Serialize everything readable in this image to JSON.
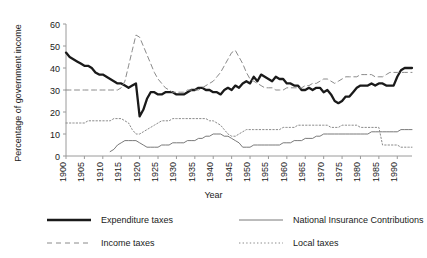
{
  "chart_data": {
    "type": "line",
    "title": "",
    "xlabel": "Year",
    "ylabel": "Percentage of government income",
    "xlim": [
      1900,
      1994
    ],
    "ylim": [
      0,
      60
    ],
    "yticks": [
      0,
      10,
      20,
      30,
      40,
      50,
      60
    ],
    "xticks": [
      1900,
      1905,
      1910,
      1915,
      1920,
      1925,
      1930,
      1935,
      1940,
      1945,
      1950,
      1955,
      1960,
      1965,
      1970,
      1975,
      1980,
      1985,
      1990
    ],
    "grid": false,
    "legend_position": "below",
    "x": [
      1900,
      1901,
      1902,
      1903,
      1904,
      1905,
      1906,
      1907,
      1908,
      1909,
      1910,
      1911,
      1912,
      1913,
      1914,
      1915,
      1916,
      1917,
      1918,
      1919,
      1920,
      1921,
      1922,
      1923,
      1924,
      1925,
      1926,
      1927,
      1928,
      1929,
      1930,
      1931,
      1932,
      1933,
      1934,
      1935,
      1936,
      1937,
      1938,
      1939,
      1940,
      1941,
      1942,
      1943,
      1944,
      1945,
      1946,
      1947,
      1948,
      1949,
      1950,
      1951,
      1952,
      1953,
      1954,
      1955,
      1956,
      1957,
      1958,
      1959,
      1960,
      1961,
      1962,
      1963,
      1964,
      1965,
      1966,
      1967,
      1968,
      1969,
      1970,
      1971,
      1972,
      1973,
      1974,
      1975,
      1976,
      1977,
      1978,
      1979,
      1980,
      1981,
      1982,
      1983,
      1984,
      1985,
      1986,
      1987,
      1988,
      1989,
      1990,
      1991,
      1992,
      1993,
      1994
    ],
    "series": [
      {
        "name": "Expenditure taxes",
        "style": "thick-solid",
        "color": "#1a1a1a",
        "values": [
          47,
          45,
          44,
          43,
          42,
          41,
          41,
          40,
          38,
          37,
          37,
          36,
          35,
          34,
          33,
          33,
          32,
          31,
          32,
          33,
          18,
          21,
          26,
          29,
          29,
          28,
          28,
          29,
          29,
          29,
          28,
          28,
          28,
          29,
          30,
          30,
          31,
          31,
          30,
          30,
          29,
          29,
          28,
          30,
          31,
          30,
          32,
          31,
          33,
          34,
          33,
          36,
          34,
          37,
          36,
          35,
          34,
          36,
          35,
          35,
          33,
          33,
          32,
          32,
          30,
          30,
          31,
          30,
          31,
          31,
          29,
          30,
          28,
          25,
          24,
          25,
          27,
          27,
          29,
          31,
          32,
          32,
          32,
          33,
          32,
          33,
          33,
          32,
          32,
          32,
          36,
          39,
          40,
          40,
          40
        ]
      },
      {
        "name": "Income taxes",
        "style": "dashed",
        "color": "#8a8a8a",
        "values": [
          30,
          30,
          30,
          30,
          30,
          30,
          30,
          30,
          30,
          30,
          30,
          30,
          30,
          30,
          30,
          31,
          34,
          41,
          48,
          55,
          54,
          50,
          46,
          42,
          38,
          35,
          33,
          31,
          30,
          29,
          29,
          29,
          29,
          30,
          30,
          30,
          30,
          31,
          32,
          33,
          34,
          36,
          38,
          41,
          44,
          47,
          48,
          45,
          42,
          38,
          35,
          34,
          33,
          32,
          31,
          31,
          31,
          30,
          30,
          30,
          31,
          31,
          31,
          31,
          31,
          32,
          32,
          33,
          33,
          34,
          35,
          35,
          34,
          33,
          34,
          35,
          36,
          36,
          36,
          36,
          37,
          37,
          37,
          37,
          36,
          36,
          36,
          37,
          38,
          38,
          38,
          38,
          38,
          38,
          38
        ]
      },
      {
        "name": "National Insurance Contributions",
        "style": "thin-solid",
        "color": "#6a6a6a",
        "values": [
          null,
          null,
          null,
          null,
          null,
          null,
          null,
          null,
          null,
          null,
          null,
          null,
          2,
          3,
          5,
          6,
          7,
          7,
          7,
          7,
          6,
          5,
          4,
          4,
          4,
          4,
          5,
          5,
          5,
          6,
          6,
          6,
          6,
          7,
          7,
          7,
          8,
          8,
          9,
          9,
          10,
          10,
          10,
          9,
          9,
          8,
          7,
          6,
          4,
          4,
          4,
          5,
          5,
          5,
          5,
          5,
          5,
          5,
          5,
          6,
          6,
          6,
          7,
          7,
          7,
          8,
          8,
          8,
          9,
          9,
          10,
          10,
          10,
          10,
          10,
          10,
          10,
          10,
          10,
          10,
          10,
          10,
          10,
          11,
          11,
          11,
          11,
          11,
          11,
          11,
          11,
          12,
          12,
          12,
          12
        ]
      },
      {
        "name": "Local taxes",
        "style": "dotted",
        "color": "#8a8a8a",
        "values": [
          15,
          15,
          15,
          15,
          15,
          15,
          16,
          16,
          16,
          16,
          16,
          16,
          16,
          17,
          17,
          17,
          16,
          15,
          12,
          10,
          10,
          11,
          12,
          13,
          14,
          15,
          16,
          16,
          16,
          17,
          17,
          17,
          17,
          17,
          17,
          17,
          17,
          17,
          17,
          16,
          16,
          15,
          14,
          12,
          10,
          9,
          9,
          10,
          11,
          12,
          12,
          12,
          12,
          12,
          12,
          12,
          12,
          12,
          12,
          13,
          13,
          13,
          13,
          14,
          14,
          14,
          14,
          14,
          14,
          14,
          14,
          14,
          13,
          13,
          13,
          14,
          14,
          14,
          14,
          14,
          13,
          13,
          13,
          13,
          13,
          13,
          5,
          5,
          5,
          5,
          5,
          4,
          4,
          4,
          4
        ]
      }
    ]
  },
  "legend": {
    "items": [
      {
        "label": "Expenditure taxes",
        "style": "thick-solid"
      },
      {
        "label": "Income taxes",
        "style": "dashed"
      },
      {
        "label": "National Insurance Contributions",
        "style": "thin-solid"
      },
      {
        "label": "Local taxes",
        "style": "dotted"
      }
    ]
  }
}
